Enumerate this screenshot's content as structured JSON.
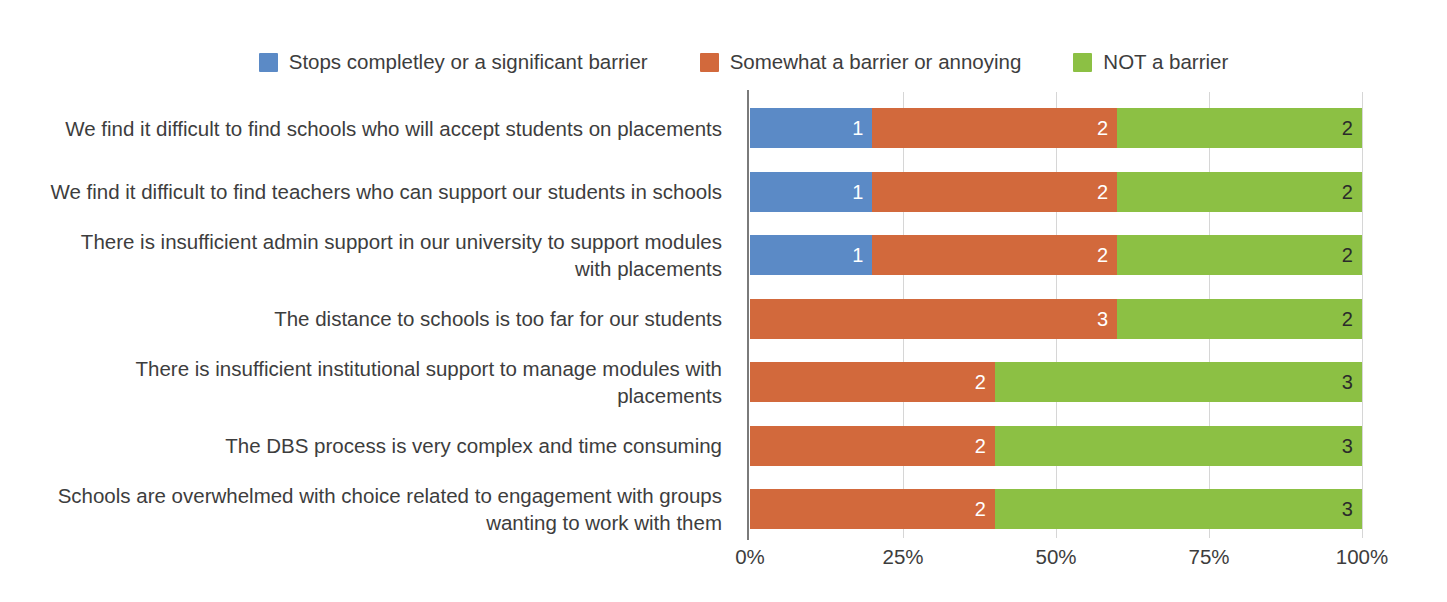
{
  "chart_data": {
    "type": "bar",
    "orientation": "horizontal",
    "stacked": true,
    "normalized": "percent",
    "title": "",
    "subtitle": "",
    "xlabel": "",
    "ylabel": "",
    "xlim": [
      0,
      100
    ],
    "xticks": [
      "0%",
      "25%",
      "50%",
      "75%",
      "100%"
    ],
    "xtick_values": [
      0,
      25,
      50,
      75,
      100
    ],
    "grid": "vertical",
    "legend_position": "top-center",
    "categories": [
      "We find it difficult to find schools who will accept students on placements",
      "We find it difficult to find teachers who can support our students in schools",
      "There is insufficient admin support in our university to support modules with placements",
      "The distance to schools is too far for our students",
      "There is insufficient institutional support to manage modules with placements",
      "The DBS process is very complex and time consuming",
      "Schools are overwhelmed with choice related to engagement with groups wanting to work with them"
    ],
    "category_lines": [
      [
        "We find it difficult to find schools who will accept students on placements"
      ],
      [
        "We find it difficult to find teachers who can support our students in schools"
      ],
      [
        "There is insufficient admin support in our university to support modules",
        "with placements"
      ],
      [
        "The distance to schools is too far for our students"
      ],
      [
        "There is insufficient institutional support to manage modules with placements"
      ],
      [
        "The DBS process is very complex and time consuming"
      ],
      [
        "Schools are overwhelmed with choice related to engagement with groups",
        "wanting to work with them"
      ]
    ],
    "series": [
      {
        "name": "Stops completley or a significant barrier",
        "color": "#5B8AC6",
        "values": [
          1,
          1,
          1,
          0,
          0,
          0,
          0
        ],
        "percents": [
          20,
          20,
          20,
          0,
          0,
          0,
          0
        ]
      },
      {
        "name": "Somewhat a barrier or  annoying",
        "color": "#D2693C",
        "values": [
          2,
          2,
          2,
          3,
          2,
          2,
          2
        ],
        "percents": [
          40,
          40,
          40,
          60,
          40,
          40,
          40
        ]
      },
      {
        "name": "NOT a barrier",
        "color": "#8CC044",
        "values": [
          2,
          2,
          2,
          2,
          3,
          3,
          3
        ],
        "percents": [
          40,
          40,
          40,
          40,
          60,
          60,
          60
        ]
      }
    ]
  },
  "legend": {
    "items": [
      {
        "label": "Stops completley or a significant barrier",
        "color": "#5B8AC6"
      },
      {
        "label": "Somewhat a barrier or  annoying",
        "color": "#D2693C"
      },
      {
        "label": "NOT a barrier",
        "color": "#8CC044"
      }
    ]
  },
  "axis": {
    "ticks": [
      "0%",
      "25%",
      "50%",
      "75%",
      "100%"
    ]
  },
  "colors": {
    "series_blue": "#5B8AC6",
    "series_orange": "#D2693C",
    "series_green": "#8CC044",
    "gridline": "#d6d6d6",
    "axis_line": "#7a7a7a",
    "text": "#3d3d3d",
    "label_on_dark": "#ffffff",
    "label_on_light": "#2b2b2b",
    "background": "#ffffff"
  }
}
